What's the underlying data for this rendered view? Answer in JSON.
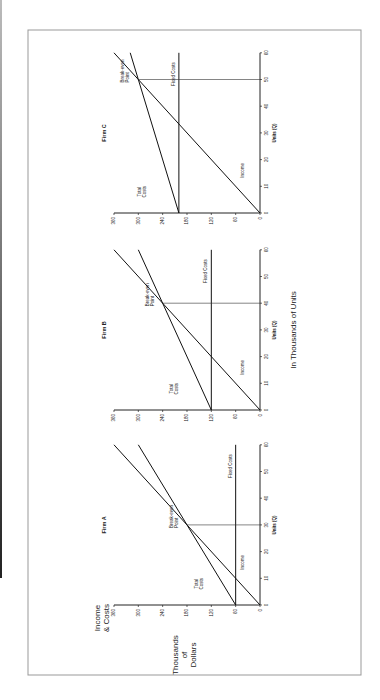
{
  "figure": {
    "y_axis_title_line1": "Income",
    "y_axis_title_line2": "& Costs",
    "y_units_line1": "Thousands",
    "y_units_line2": "of",
    "y_units_line3": "Dollars",
    "x_common_label": "In Thousands of Units"
  },
  "chart_data": [
    {
      "type": "line",
      "title": "Firm A",
      "xlabel": "Units (Q)",
      "ylabel": "Income & Costs (Thousands of Dollars)",
      "x_ticks": [
        "0",
        "10",
        "20",
        "30",
        "40",
        "50",
        "60"
      ],
      "y_ticks": [
        "0",
        "60",
        "120",
        "180",
        "240",
        "300",
        "360"
      ],
      "xlim": [
        0,
        60
      ],
      "ylim": [
        0,
        360
      ],
      "series": [
        {
          "name": "Income",
          "x": [
            0,
            60
          ],
          "y": [
            0,
            360
          ]
        },
        {
          "name": "Total Costs",
          "x": [
            0,
            60
          ],
          "y": [
            60,
            300
          ]
        },
        {
          "name": "Fixed Costs",
          "x": [
            0,
            60
          ],
          "y": [
            60,
            60
          ]
        }
      ],
      "annotations": [
        {
          "text": "Break-even Point",
          "x": 30,
          "y": 180
        }
      ],
      "labels": {
        "income": "Income",
        "total_costs_1": "Total",
        "total_costs_2": "Costs",
        "fixed_costs": "Fixed Costs",
        "break_even_1": "Break-even",
        "break_even_2": "Point"
      }
    },
    {
      "type": "line",
      "title": "Firm B",
      "xlabel": "Units (Q)",
      "ylabel": "Income & Costs (Thousands of Dollars)",
      "x_ticks": [
        "0",
        "10",
        "20",
        "30",
        "40",
        "50",
        "60"
      ],
      "y_ticks": [
        "0",
        "60",
        "120",
        "180",
        "240",
        "300",
        "360"
      ],
      "xlim": [
        0,
        60
      ],
      "ylim": [
        0,
        360
      ],
      "series": [
        {
          "name": "Income",
          "x": [
            0,
            60
          ],
          "y": [
            0,
            360
          ]
        },
        {
          "name": "Total Costs",
          "x": [
            0,
            60
          ],
          "y": [
            120,
            300
          ]
        },
        {
          "name": "Fixed Costs",
          "x": [
            0,
            60
          ],
          "y": [
            120,
            120
          ]
        }
      ],
      "annotations": [
        {
          "text": "Break-even Point",
          "x": 40,
          "y": 240
        }
      ],
      "labels": {
        "income": "Income",
        "total_costs_1": "Total",
        "total_costs_2": "Costs",
        "fixed_costs": "Fixed Costs",
        "break_even_1": "Break-even",
        "break_even_2": "Point"
      }
    },
    {
      "type": "line",
      "title": "Firm C",
      "xlabel": "Units (Q)",
      "ylabel": "Income & Costs (Thousands of Dollars)",
      "x_ticks": [
        "0",
        "10",
        "20",
        "30",
        "40",
        "50",
        "60"
      ],
      "y_ticks": [
        "0",
        "60",
        "120",
        "180",
        "240",
        "300",
        "360"
      ],
      "xlim": [
        0,
        60
      ],
      "ylim": [
        0,
        360
      ],
      "series": [
        {
          "name": "Income",
          "x": [
            0,
            60
          ],
          "y": [
            0,
            360
          ]
        },
        {
          "name": "Total Costs",
          "x": [
            0,
            60
          ],
          "y": [
            200,
            320
          ]
        },
        {
          "name": "Fixed Costs",
          "x": [
            0,
            60
          ],
          "y": [
            200,
            200
          ]
        }
      ],
      "annotations": [
        {
          "text": "Break-even Point",
          "x": 50,
          "y": 300
        }
      ],
      "labels": {
        "income": "Income",
        "total_costs_1": "Total",
        "total_costs_2": "Costs",
        "fixed_costs": "Fixed Costs",
        "break_even_1": "Break-even",
        "break_even_2": "Point"
      }
    }
  ]
}
